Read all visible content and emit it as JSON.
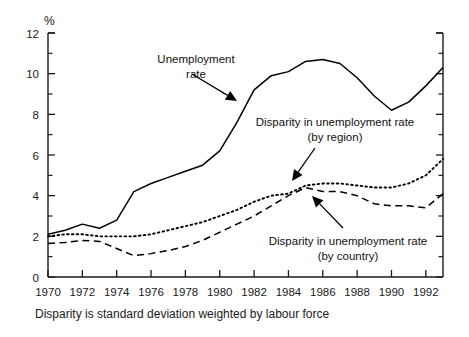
{
  "chart_data": {
    "type": "line",
    "title": "",
    "xlabel": "",
    "ylabel": "%",
    "ylim": [
      0,
      12
    ],
    "xlim": [
      1970,
      1993
    ],
    "grid": false,
    "legend_position": "none",
    "y_ticks": [
      0,
      2,
      4,
      6,
      8,
      10,
      12
    ],
    "y_minor_ticks": [
      1,
      3,
      5,
      7,
      9,
      11
    ],
    "x_ticks": [
      1970,
      1972,
      1974,
      1976,
      1978,
      1980,
      1982,
      1984,
      1986,
      1988,
      1990,
      1992
    ],
    "x_tick_labels": [
      "1970",
      "1972",
      "1974",
      "1976",
      "1978",
      "1980",
      "1982",
      "1984",
      "1986",
      "1988",
      "1990",
      "1992"
    ],
    "y_tick_labels": [
      "0",
      "2",
      "4",
      "6",
      "8",
      "10",
      "12"
    ],
    "x": [
      1970,
      1971,
      1972,
      1973,
      1974,
      1975,
      1976,
      1977,
      1978,
      1979,
      1980,
      1981,
      1982,
      1983,
      1984,
      1985,
      1986,
      1987,
      1988,
      1989,
      1990,
      1991,
      1992,
      1993
    ],
    "series": [
      {
        "name": "Unemployment rate",
        "style": "solid",
        "values": [
          2.1,
          2.3,
          2.6,
          2.4,
          2.8,
          4.2,
          4.6,
          4.9,
          5.2,
          5.5,
          6.2,
          7.6,
          9.2,
          9.9,
          10.1,
          10.6,
          10.7,
          10.5,
          9.8,
          8.9,
          8.2,
          8.6,
          9.4,
          10.3
        ]
      },
      {
        "name": "Disparity in unemployment rate (by region)",
        "style": "dotted",
        "values": [
          2.0,
          2.1,
          2.1,
          2.0,
          2.0,
          2.0,
          2.1,
          2.3,
          2.5,
          2.7,
          3.0,
          3.3,
          3.7,
          4.0,
          4.1,
          4.5,
          4.6,
          4.6,
          4.5,
          4.4,
          4.4,
          4.6,
          5.0,
          5.8
        ]
      },
      {
        "name": "Disparity in unemployment rate (by country)",
        "style": "dashed",
        "values": [
          1.65,
          1.7,
          1.8,
          1.75,
          1.4,
          1.05,
          1.15,
          1.3,
          1.5,
          1.8,
          2.2,
          2.6,
          3.0,
          3.5,
          4.0,
          4.4,
          4.2,
          4.2,
          4.0,
          3.6,
          3.5,
          3.5,
          3.4,
          4.1
        ]
      }
    ],
    "annotations": [
      {
        "id": "unemployment-rate",
        "lines": [
          "Unemployment",
          "rate"
        ],
        "text_x": 196,
        "text_y": 63,
        "align": "middle",
        "arrow_from_x": 192,
        "arrow_from_y": 74,
        "arrow_to_x": 237,
        "arrow_to_y": 101
      },
      {
        "id": "disparity-by-region",
        "lines": [
          "Disparity in unemployment rate",
          "(by region)"
        ],
        "text_x": 335,
        "text_y": 126,
        "align": "middle",
        "arrow_from_x": 315,
        "arrow_from_y": 148,
        "arrow_to_x": 292,
        "arrow_to_y": 181
      },
      {
        "id": "disparity-by-country",
        "lines": [
          "Disparity in unemployment rate",
          "(by country)"
        ],
        "text_x": 348,
        "text_y": 245,
        "align": "middle",
        "arrow_from_x": 343,
        "arrow_from_y": 228,
        "arrow_to_x": 312,
        "arrow_to_y": 196
      }
    ],
    "caption": "Disparity is standard deviation weighted by labour force",
    "colors": {
      "line": "#000000",
      "axis": "#1a1a1a",
      "text": "#1a1a1a",
      "background": "#ffffff"
    }
  }
}
